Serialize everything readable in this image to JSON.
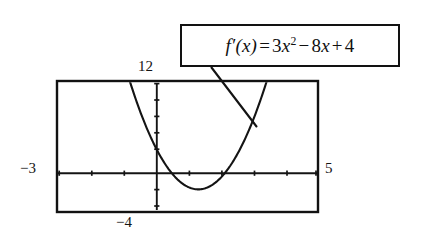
{
  "figure": {
    "kind": "graphing-calculator-screen",
    "callout": {
      "label": "f'(x) = 3x² − 8x + 4",
      "function_name": "f'",
      "variable": "x",
      "equals": "=",
      "term1_coefficient": "3",
      "term1_power": "2",
      "term2_sign": "−",
      "term2_coefficient": "8",
      "term3_sign": "+",
      "term3_constant": "4"
    },
    "window_labels": {
      "xmin": "−3",
      "xmax": "5",
      "ymax": "12",
      "ymin": "−4"
    },
    "colors": {
      "ink": "#121212",
      "background": "#ffffff",
      "curve": "#141414"
    }
  },
  "chart_data": {
    "type": "line",
    "title": "",
    "subtitle": "",
    "xlabel": "",
    "ylabel": "",
    "expression": "y = 3x^2 - 8x + 4",
    "coefficients": {
      "a": 3,
      "b": -8,
      "c": 4
    },
    "xlim": [
      -3,
      5
    ],
    "ylim": [
      -4,
      12
    ],
    "grid": false,
    "legend": "none",
    "axes": {
      "x_axis_at_y": 0,
      "y_axis_at_x": 0,
      "x_tick_step": 1,
      "y_tick_step": 2,
      "x_ticks": [
        -3,
        -2,
        -1,
        0,
        1,
        2,
        3,
        4,
        5
      ],
      "y_ticks": [
        -4,
        -2,
        0,
        2,
        4,
        6,
        8,
        10,
        12
      ]
    },
    "features": {
      "vertex": [
        1.333,
        -1.333
      ],
      "roots": [
        0.667,
        2
      ],
      "y_intercept": 4
    },
    "x": [
      -3,
      -2.75,
      -2.5,
      -2.25,
      -2,
      -1.75,
      -1.5,
      -1.25,
      -1,
      -0.75,
      -0.5,
      -0.25,
      0,
      0.25,
      0.5,
      0.75,
      1,
      1.25,
      1.5,
      1.75,
      2,
      2.25,
      2.5,
      2.75,
      3,
      3.25,
      3.5,
      3.75,
      4,
      4.25,
      4.5,
      4.75,
      5
    ],
    "values": [
      55,
      48.7,
      42.75,
      37.2,
      32,
      27.2,
      22.75,
      18.7,
      15,
      11.7,
      8.75,
      6.2,
      4,
      2.2,
      0.75,
      -0.3,
      -1,
      -1.3,
      -1.25,
      -0.8,
      0,
      1.2,
      2.75,
      4.7,
      7,
      9.7,
      12.75,
      16.2,
      20,
      24.2,
      28.75,
      33.7,
      39
    ],
    "annotations": [
      {
        "text": "f'(x) = 3x² − 8x + 4",
        "points_to_curve": true
      }
    ]
  }
}
